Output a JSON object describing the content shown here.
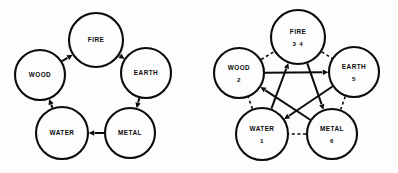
{
  "figure": {
    "background_color": "#fdfdfd",
    "ink_color": "#0b0b0b",
    "panel_count": 2
  },
  "panels": [
    {
      "id": "generating-cycle",
      "name": "left-diagram",
      "caption": "",
      "edge_style": "solid",
      "nodes": [
        {
          "id": "fire",
          "label": "FIRE",
          "number": "",
          "cx": 96,
          "cy": 40,
          "r": 27
        },
        {
          "id": "earth",
          "label": "EARTH",
          "number": "",
          "cx": 146,
          "cy": 73,
          "r": 25
        },
        {
          "id": "metal",
          "label": "METAL",
          "number": "",
          "cx": 130,
          "cy": 133,
          "r": 25
        },
        {
          "id": "water",
          "label": "WATER",
          "number": "",
          "cx": 62,
          "cy": 133,
          "r": 26
        },
        {
          "id": "wood",
          "label": "WOOD",
          "number": "",
          "cx": 40,
          "cy": 75,
          "r": 25
        }
      ],
      "edges": [
        {
          "from": "metal",
          "to": "water",
          "style": "solid",
          "arrow": "to"
        },
        {
          "from": "water",
          "to": "wood",
          "style": "solid",
          "arrow": "to"
        },
        {
          "from": "wood",
          "to": "fire",
          "style": "solid",
          "arrow": "to"
        },
        {
          "from": "fire",
          "to": "earth",
          "style": "solid",
          "arrow": "to"
        },
        {
          "from": "earth",
          "to": "metal",
          "style": "solid",
          "arrow": "to"
        }
      ]
    },
    {
      "id": "overcoming-cycle",
      "name": "right-diagram",
      "caption": "",
      "edge_style": "mixed",
      "nodes": [
        {
          "id": "fire",
          "label": "FIRE",
          "number": "3 4",
          "cx": 99,
          "cy": 37,
          "r": 27
        },
        {
          "id": "earth",
          "label": "EARTH",
          "number": "5",
          "cx": 155,
          "cy": 72,
          "r": 25
        },
        {
          "id": "metal",
          "label": "METAL",
          "number": "6",
          "cx": 133,
          "cy": 134,
          "r": 25
        },
        {
          "id": "water",
          "label": "WATER",
          "number": "1",
          "cx": 63,
          "cy": 134,
          "r": 26
        },
        {
          "id": "wood",
          "label": "WOOD",
          "number": "2",
          "cx": 40,
          "cy": 73,
          "r": 25
        }
      ],
      "edges": [
        {
          "from": "wood",
          "to": "earth",
          "style": "solid",
          "arrow": "to"
        },
        {
          "from": "earth",
          "to": "water",
          "style": "solid",
          "arrow": "to"
        },
        {
          "from": "water",
          "to": "fire",
          "style": "solid",
          "arrow": "to"
        },
        {
          "from": "fire",
          "to": "metal",
          "style": "solid",
          "arrow": "to"
        },
        {
          "from": "metal",
          "to": "wood",
          "style": "solid",
          "arrow": "to"
        },
        {
          "from": "wood",
          "to": "fire",
          "style": "dashed",
          "arrow": "none"
        },
        {
          "from": "fire",
          "to": "earth",
          "style": "dashed",
          "arrow": "none"
        },
        {
          "from": "earth",
          "to": "metal",
          "style": "dashed",
          "arrow": "none"
        },
        {
          "from": "metal",
          "to": "water",
          "style": "dashed",
          "arrow": "none"
        },
        {
          "from": "water",
          "to": "wood",
          "style": "dashed",
          "arrow": "none"
        }
      ]
    }
  ]
}
